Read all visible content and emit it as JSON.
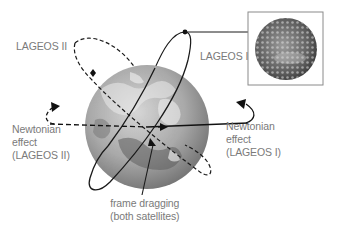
{
  "diagram": {
    "labels": {
      "lageos_ii": "LAGEOS II",
      "lageos_i": "LAGEOS I",
      "newtonian_left": [
        "Newtonian",
        "effect",
        "(LAGEOS II)"
      ],
      "newtonian_right": [
        "Newtonian",
        "effect",
        "(LAGEOS I)"
      ],
      "frame_dragging": [
        "frame dragging",
        "(both satellites)"
      ]
    },
    "elements": {
      "earth": "Earth globe (grayscale relief)",
      "inset": "LAGEOS satellite photo (retroreflector-covered sphere)",
      "orbit_lageos_i": "solid ellipse",
      "orbit_lageos_ii": "dashed ellipse"
    },
    "colors": {
      "text": "#7a7a7a",
      "lines": "#1a1a1a",
      "inset_border": "#8a8a8a",
      "earth_light": "#c8c8c8",
      "earth_dark": "#6e6e6e"
    }
  }
}
